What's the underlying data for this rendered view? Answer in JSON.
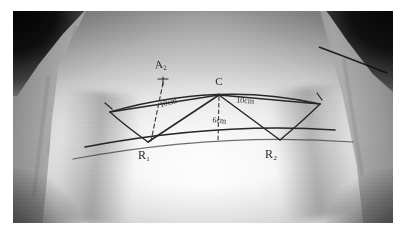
{
  "image": {
    "kind": "clinical-photograph",
    "subject": "lower back / flank with pre-operative surgical skin markings",
    "rendering": "grayscale",
    "border_color": "#ffffff",
    "frame": {
      "left": 13,
      "top": 11,
      "width": 380,
      "height": 212
    }
  },
  "markings": {
    "ink_color": "#2b2a28",
    "dashed_color": "#3a3936",
    "labels": [
      {
        "id": "a2",
        "text": "A₂",
        "x": 148,
        "y": 57,
        "size": 11,
        "rotate": -6,
        "name": "label-a2"
      },
      {
        "id": "c",
        "text": "C",
        "x": 206,
        "y": 74,
        "size": 11,
        "rotate": 0,
        "name": "label-c"
      },
      {
        "id": "left10",
        "text": "10cm",
        "x": 156,
        "y": 94,
        "size": 8,
        "rotate": -16,
        "name": "label-left-10cm"
      },
      {
        "id": "right10",
        "text": "10cm",
        "x": 232,
        "y": 92,
        "size": 8,
        "rotate": 4,
        "name": "label-right-10cm"
      },
      {
        "id": "mid6",
        "text": "6cm",
        "x": 206,
        "y": 112,
        "size": 8,
        "rotate": 6,
        "name": "label-mid-6cm"
      },
      {
        "id": "r1",
        "text": "R₁",
        "x": 131,
        "y": 148,
        "size": 12,
        "rotate": 0,
        "name": "label-r1"
      },
      {
        "id": "r2",
        "text": "R₂",
        "x": 258,
        "y": 147,
        "size": 12,
        "rotate": 0,
        "name": "label-r2"
      }
    ],
    "measurements": [
      {
        "segment": "C to R₁",
        "value": "10cm"
      },
      {
        "segment": "C to R₂",
        "value": "10cm"
      },
      {
        "segment": "C vertical drop",
        "value": "6cm"
      }
    ],
    "vertices": [
      {
        "id": "C",
        "x": 206,
        "y": 84,
        "name": "vertex-c"
      },
      {
        "id": "R1",
        "x": 135,
        "y": 131,
        "name": "vertex-r1"
      },
      {
        "id": "R2",
        "x": 267,
        "y": 129,
        "name": "vertex-r2"
      },
      {
        "id": "L",
        "x": 97,
        "y": 101,
        "name": "vertex-left"
      },
      {
        "id": "Rt",
        "x": 307,
        "y": 93,
        "name": "vertex-right"
      }
    ],
    "paths": {
      "upper_arc": "M 97 101 Q 205 70 307 93",
      "lower_arc": "M 72 136 Q 205 111 322 119",
      "left_limb": "M 97 101 L 206 84",
      "right_limb": "M 307 93 L 206 84",
      "c_to_r1": "M 206 84 L 135 131",
      "c_to_r2": "M 206 84 L 267 129",
      "r1_to_left": "M 135 131 Q 110 113 97 101",
      "r2_to_right": "M 267 129 Q 292 108 307 93",
      "lower_edge": "M 60 148 Q 205 121 340 131",
      "a2_dashed": "M 150 72 L 138 130",
      "c_dashed": "M 206 86 L 205 131"
    }
  }
}
